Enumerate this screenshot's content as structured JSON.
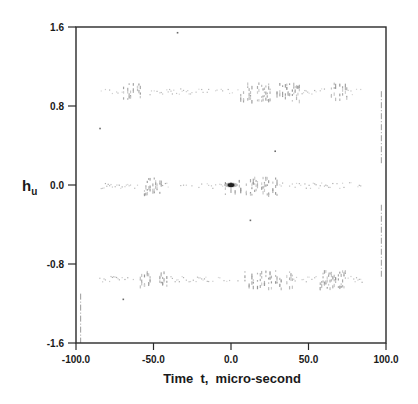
{
  "chart_data": {
    "type": "scatter",
    "title": "",
    "xlabel": "Time  t,  micro-second",
    "ylabel": "h",
    "ylabel_subscript": "u",
    "xlim": [
      -100,
      100
    ],
    "ylim": [
      -1.6,
      1.6
    ],
    "x_ticks": [
      -100.0,
      -50.0,
      0.0,
      50.0,
      100.0
    ],
    "x_tick_labels": [
      "-100.0",
      "-50.0",
      "0.0",
      "50.0",
      "100.0"
    ],
    "y_ticks": [
      1.6,
      0.8,
      0.0,
      -0.8,
      -1.6
    ],
    "y_tick_labels": [
      "1.6",
      "0.8",
      "0.0",
      "-0.8",
      "-1.6"
    ],
    "grid": false,
    "legend": null,
    "series": [
      {
        "name": "upper band",
        "description": "faint scattered points near h = +0.95",
        "y_level": 0.95,
        "x_range": [
          -85,
          85
        ],
        "dense_regions": [
          [
            -70,
            -55
          ],
          [
            5,
            45
          ],
          [
            60,
            75
          ]
        ]
      },
      {
        "name": "middle band",
        "description": "faint scattered points near h = 0.0",
        "y_level": 0.0,
        "x_range": [
          -85,
          85
        ],
        "dense_regions": [
          [
            -60,
            -45
          ],
          [
            -5,
            30
          ]
        ]
      },
      {
        "name": "lower band",
        "description": "faint scattered points near h = -0.95",
        "y_level": -0.95,
        "x_range": [
          -85,
          85
        ],
        "dense_regions": [
          [
            -60,
            -40
          ],
          [
            5,
            40
          ],
          [
            55,
            75
          ]
        ]
      },
      {
        "name": "peak",
        "description": "dark dense point at origin",
        "x": [
          0.0
        ],
        "y": [
          0.0
        ]
      },
      {
        "name": "isolated points",
        "x": [
          -35.0,
          -85.0,
          -70.0,
          12.0,
          28.0
        ],
        "y": [
          1.55,
          0.58,
          -1.15,
          -0.35,
          0.35
        ]
      },
      {
        "name": "edge traces",
        "description": "faint vertical traces near t = 97 and t = -97",
        "segments": [
          {
            "x": 97,
            "y_from": 0.95,
            "y_to": 0.2
          },
          {
            "x": 97,
            "y_from": -0.2,
            "y_to": -0.95
          },
          {
            "x": -97,
            "y_from": -1.1,
            "y_to": -1.6
          }
        ]
      }
    ]
  },
  "labels": {
    "xlabel": "Time  t,  micro-second",
    "ylabel_main": "h",
    "ylabel_sub": "u"
  }
}
